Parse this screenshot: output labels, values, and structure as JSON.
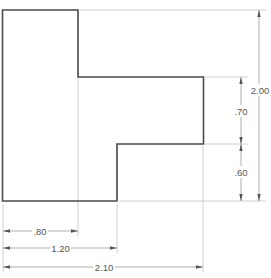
{
  "drawing": {
    "type": "orthographic-view-dimensioned",
    "units_scale_px_per_unit": 96,
    "dimensions": {
      "horizontal": [
        {
          "label": ".80",
          "value": 0.8
        },
        {
          "label": "1.20",
          "value": 1.2
        },
        {
          "label": "2.10",
          "value": 2.1
        }
      ],
      "vertical": [
        {
          "label": ".70",
          "value": 0.7
        },
        {
          "label": ".60",
          "value": 0.6
        },
        {
          "label": "2.00",
          "value": 2.0
        }
      ]
    },
    "colors": {
      "outline": "#4a4a4a",
      "extension_lines": "#c4c4c4",
      "dimension_lines": "#9a9a9a",
      "text": "#555555"
    }
  }
}
